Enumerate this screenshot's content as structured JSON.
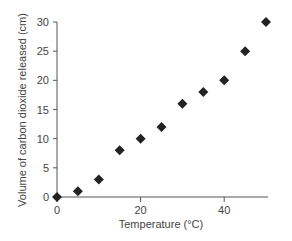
{
  "chart_data": {
    "type": "scatter",
    "title": "",
    "xlabel": "Temperature (°C)",
    "ylabel": "Volume of carbon dioxide released (cm)",
    "xlim": [
      0,
      50
    ],
    "ylim": [
      0,
      30
    ],
    "x_ticks": [
      0,
      20,
      40
    ],
    "y_ticks": [
      0,
      5,
      10,
      15,
      20,
      25,
      30
    ],
    "grid": false,
    "legend": null,
    "marker": "diamond",
    "marker_color": "#222222",
    "series": [
      {
        "name": "CO2 released",
        "x": [
          0,
          5,
          10,
          15,
          20,
          25,
          30,
          35,
          40,
          45,
          50
        ],
        "y": [
          0,
          1,
          3,
          8,
          10,
          12,
          16,
          18,
          20,
          25,
          30
        ]
      }
    ]
  },
  "labels": {
    "x_axis_title": "Temperature (°C)",
    "y_axis_title": "Volume of carbon dioxide released (cm)"
  }
}
